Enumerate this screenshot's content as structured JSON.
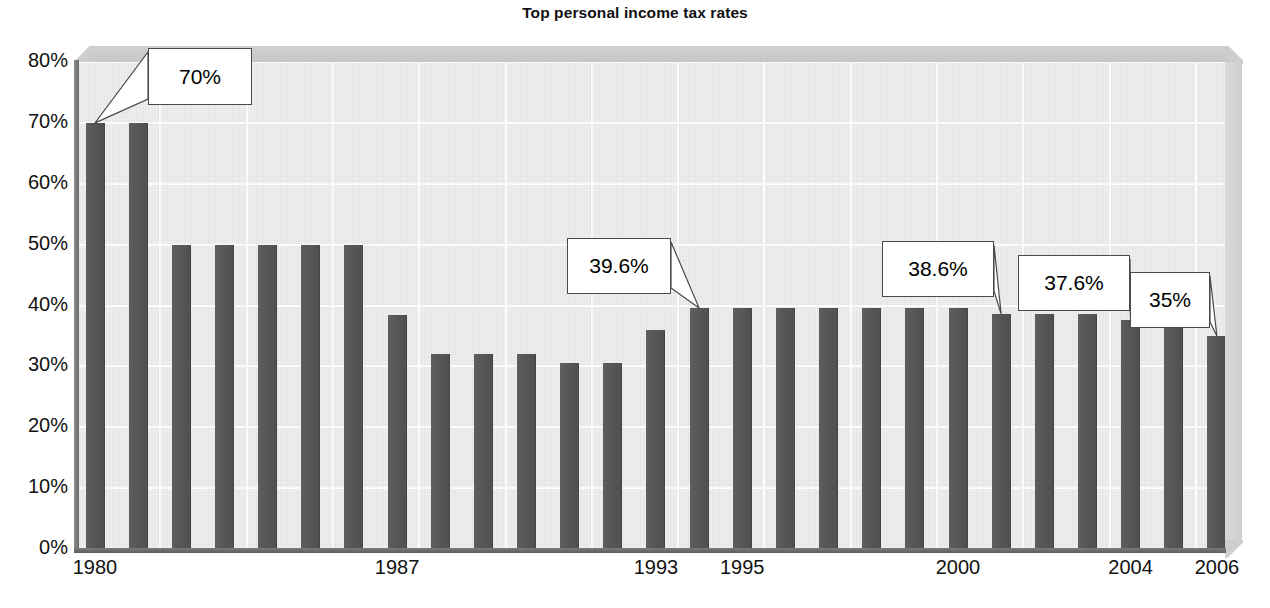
{
  "chart_data": {
    "type": "bar",
    "title": "Top personal income tax rates",
    "xlabel": "",
    "ylabel": "",
    "ylim": [
      0,
      80
    ],
    "grid": true,
    "legend": "none",
    "y_ticks": [
      "0%",
      "10%",
      "20%",
      "30%",
      "40%",
      "50%",
      "60%",
      "70%",
      "80%"
    ],
    "y_tick_values": [
      0,
      10,
      20,
      30,
      40,
      50,
      60,
      70,
      80
    ],
    "x_tick_labels": [
      "1980",
      "1987",
      "1993",
      "1995",
      "2000",
      "2004",
      "2006"
    ],
    "categories": [
      "1980",
      "1981",
      "1982",
      "1983",
      "1984",
      "1985",
      "1986",
      "1987",
      "1988",
      "1989",
      "1990",
      "1991",
      "1992",
      "1993",
      "1994",
      "1995",
      "1996",
      "1997",
      "1998",
      "1999",
      "2000",
      "2001",
      "2002",
      "2003",
      "2004",
      "2005",
      "2006"
    ],
    "values": [
      70,
      70,
      50,
      50,
      50,
      50,
      50,
      38.5,
      32,
      32,
      32,
      30.5,
      30.5,
      36,
      39.6,
      39.6,
      39.6,
      39.6,
      39.6,
      39.6,
      39.6,
      38.6,
      38.6,
      38.6,
      37.6,
      37.4,
      35
    ],
    "annotations": [
      {
        "label": "70%",
        "category": "1980",
        "value": 70
      },
      {
        "label": "39.6%",
        "category": "1994",
        "value": 39.6
      },
      {
        "label": "38.6%",
        "category": "2001",
        "value": 38.6
      },
      {
        "label": "37.6%",
        "category": "2004",
        "value": 37.6
      },
      {
        "label": "35%",
        "category": "2006",
        "value": 35
      }
    ],
    "colors": {
      "bar": "#565656",
      "plot_background": "#e9e9e9",
      "gridline": "#fbfbfb",
      "axis": "#6a6a6a",
      "callout_border": "#4a4a4a",
      "callout_background": "#ffffff",
      "text": "#111111"
    }
  }
}
